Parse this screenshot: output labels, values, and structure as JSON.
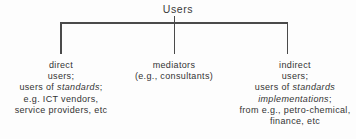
{
  "diagram": {
    "type": "tree",
    "root": {
      "label": "Users"
    },
    "branches": [
      {
        "id": "direct-users",
        "lines": [
          "direct",
          "users;",
          "users of standards;",
          "e.g. ICT vendors,",
          "service providers, etc"
        ],
        "line1": "direct",
        "line2": "users;",
        "line3_prefix": "users of ",
        "line3_italic": "standards",
        "line3_suffix": ";",
        "line4": "e.g. ICT vendors,",
        "line5": "service providers, etc"
      },
      {
        "id": "mediators",
        "lines": [
          "mediators",
          "(e.g., consultants)"
        ],
        "line1": "mediators",
        "line2": "(e.g., consultants)"
      },
      {
        "id": "indirect-users",
        "lines": [
          "indirect",
          "users;",
          "users of standards",
          "implementations;",
          "from e.g., petro-chemical,",
          "finance, etc"
        ],
        "line1": "indirect",
        "line2": "users;",
        "line3_prefix": "users of ",
        "line3_italic": "standards",
        "line4_italic": "implementations",
        "line4_suffix": ";",
        "line5": "from e.g., petro-chemical,",
        "line6": "finance, etc"
      }
    ],
    "colors": {
      "line": "#4a4a4a",
      "text": "#333333",
      "background": "#fdfdfd"
    }
  }
}
